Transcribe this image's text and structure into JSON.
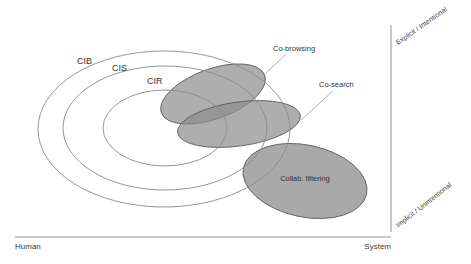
{
  "diagram": {
    "type": "venn-overlap-diagram",
    "rings": [
      {
        "id": "cib",
        "label": "CIB",
        "cx": 164,
        "cy": 129,
        "rx": 126,
        "ry": 78
      },
      {
        "id": "cis",
        "label": "CIS",
        "cx": 165,
        "cy": 128,
        "rx": 102,
        "ry": 62
      },
      {
        "id": "cir",
        "label": "CIR",
        "cx": 165,
        "cy": 128,
        "rx": 62,
        "ry": 38
      }
    ],
    "regions": [
      {
        "id": "co-browsing",
        "label": "Co-browsing",
        "cx": 213,
        "cy": 94,
        "rx": 55,
        "ry": 25,
        "rotate": -20,
        "fill": "#8c8c8c"
      },
      {
        "id": "co-search",
        "label": "Co-search",
        "cx": 239,
        "cy": 124,
        "rx": 62,
        "ry": 22,
        "rotate": -8,
        "fill": "#8c8c8c"
      },
      {
        "id": "collab-filtering",
        "label": "Collab. filtering",
        "cx": 305,
        "cy": 181,
        "rx": 63,
        "ry": 36,
        "rotate": 12,
        "fill": "#9a9a9a"
      }
    ],
    "axes": {
      "x_left_label": "Human",
      "x_right_label": "System",
      "y_top_label": "Explicit / Intentional",
      "y_bottom_label": "Implicit / Unintentional"
    },
    "colors": {
      "ring_stroke": "#8a8a8a",
      "region_fill": "#8c8c8c",
      "axis_line": "#b8b8b8",
      "text": "#333333"
    }
  }
}
